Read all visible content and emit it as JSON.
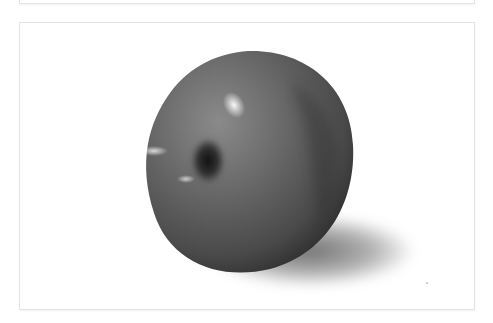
{
  "page": {
    "panels": [
      {
        "name": "top-panel",
        "content": ""
      },
      {
        "name": "photo-panel",
        "content": "photograph"
      }
    ]
  },
  "photo": {
    "subject": "apple",
    "alt": "Black and white photograph of an apple with shadow",
    "colors": {
      "background": "#ffffff",
      "border": "#e4e4e4"
    }
  }
}
